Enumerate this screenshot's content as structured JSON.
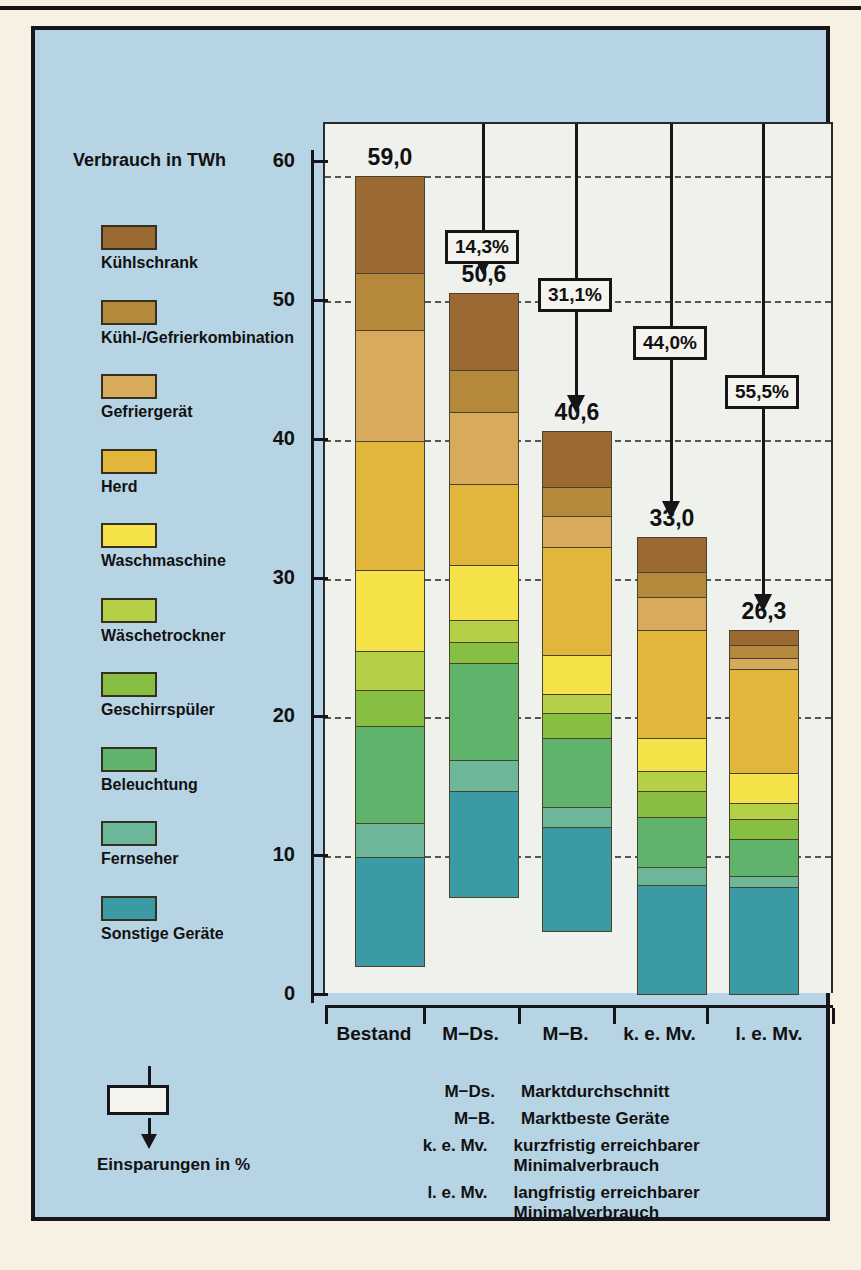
{
  "chart_data": {
    "type": "bar",
    "subtype": "stacked-bar",
    "title": "",
    "axis_title": "Verbrauch in TWh",
    "ylabel": "Verbrauch in TWh",
    "xlabel": "",
    "ylim": [
      0,
      62
    ],
    "yticks": [
      0,
      10,
      20,
      30,
      40,
      50,
      60
    ],
    "ytick_labels": [
      "0",
      "10",
      "20",
      "30",
      "40",
      "50",
      "60"
    ],
    "grid": true,
    "categories": [
      "Bestand",
      "M−Ds.",
      "M−B.",
      "k. e. Mv.",
      "l. e. Mv."
    ],
    "totals": [
      "59,0",
      "50,6",
      "40,6",
      "33,0",
      "26,3"
    ],
    "total_values": [
      59.0,
      50.6,
      40.6,
      33.0,
      26.3
    ],
    "series": [
      {
        "name": "Kühlschrank",
        "color": "#9a6a32",
        "values": [
          7.0,
          5.6,
          4.0,
          2.5,
          1.1
        ]
      },
      {
        "name": "Kühl-/Gefrierkombination",
        "color": "#b5893c",
        "values": [
          4.1,
          3.0,
          2.1,
          1.8,
          0.9
        ]
      },
      {
        "name": "Gefriergerät",
        "color": "#d7ab5b",
        "values": [
          8.0,
          5.2,
          2.2,
          2.4,
          0.8
        ]
      },
      {
        "name": "Herd",
        "color": "#e2b63a",
        "values": [
          9.3,
          5.8,
          7.8,
          7.8,
          7.5
        ]
      },
      {
        "name": "Waschmaschine",
        "color": "#f5e249",
        "values": [
          5.8,
          4.0,
          2.8,
          2.4,
          2.2
        ]
      },
      {
        "name": "Wäschetrockner",
        "color": "#b5cf47",
        "values": [
          2.8,
          1.6,
          1.4,
          1.4,
          1.1
        ]
      },
      {
        "name": "Geschirrspüler",
        "color": "#86bf42",
        "values": [
          2.6,
          1.5,
          1.8,
          1.9,
          1.5
        ]
      },
      {
        "name": "Beleuchtung",
        "color": "#5fb36a",
        "values": [
          7.0,
          7.0,
          5.0,
          3.6,
          2.6
        ]
      },
      {
        "name": "Fernseher",
        "color": "#6cb79a",
        "values": [
          2.5,
          2.2,
          1.4,
          1.3,
          0.8
        ]
      },
      {
        "name": "Sonstige Geräte",
        "color": "#3b9aa4",
        "values": [
          7.9,
          7.7,
          7.6,
          7.9,
          7.8
        ]
      }
    ],
    "annotations": [
      {
        "label": "14,3%",
        "from": "Bestand",
        "to": "M−Ds.",
        "value": 14.3
      },
      {
        "label": "31,1%",
        "from": "Bestand",
        "to": "M−B.",
        "value": 31.1
      },
      {
        "label": "44,0%",
        "from": "Bestand",
        "to": "k. e. Mv.",
        "value": 44.0
      },
      {
        "label": "55,5%",
        "from": "Bestand",
        "to": "l. e. Mv.",
        "value": 55.5
      }
    ],
    "annotation_key": "Einsparungen in %",
    "abbreviations": [
      {
        "key": "M−Ds.",
        "value": "Marktdurchschnitt"
      },
      {
        "key": "M−B.",
        "value": "Marktbeste Geräte"
      },
      {
        "key": "k. e. Mv.",
        "value": "kurzfristig erreichbarer Minimalverbrauch"
      },
      {
        "key": "l. e. Mv.",
        "value": "langfristig erreichbarer Minimalverbrauch"
      }
    ]
  },
  "colors": {
    "panel_background": "#b7d4e4",
    "plot_background": "#eef1ec",
    "page_background": "#f6f1e2",
    "ink": "#16161a"
  }
}
